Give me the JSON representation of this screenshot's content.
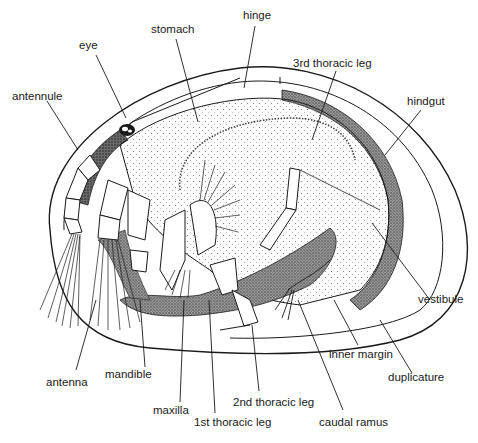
{
  "diagram": {
    "labels": {
      "stomach": "stomach",
      "hinge": "hinge",
      "eye": "eye",
      "third_thoracic_leg": "3rd thoracic leg",
      "antennule": "antennule",
      "hindgut": "hindgut",
      "vestibule": "vestibule",
      "inner_margin": "inner margin",
      "duplicature": "duplicature",
      "mandible": "mandible",
      "antenna": "antenna",
      "second_thoracic_leg": "2nd thoracic leg",
      "maxilla": "maxilla",
      "first_thoracic_leg": "1st thoracic leg",
      "caudal_ramus": "caudal ramus"
    },
    "colors": {
      "ink": "#1a1a1a",
      "background": "#ffffff",
      "stipple_dark": "#555555",
      "stipple_light": "#b5b5b5"
    }
  }
}
